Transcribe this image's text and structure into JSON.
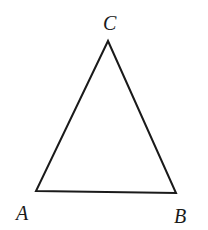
{
  "diagram": {
    "type": "triangle",
    "vertices": [
      {
        "name": "A",
        "x": 36,
        "y": 191,
        "label": "A",
        "label_x": 16,
        "label_y": 220
      },
      {
        "name": "B",
        "x": 176,
        "y": 193,
        "label": "B",
        "label_x": 174,
        "label_y": 223
      },
      {
        "name": "C",
        "x": 108,
        "y": 41,
        "label": "C",
        "label_x": 103,
        "label_y": 30
      }
    ],
    "edges": [
      [
        "A",
        "B"
      ],
      [
        "B",
        "C"
      ],
      [
        "C",
        "A"
      ]
    ],
    "stroke_color": "#1a1a1a",
    "background_color": "#ffffff"
  }
}
